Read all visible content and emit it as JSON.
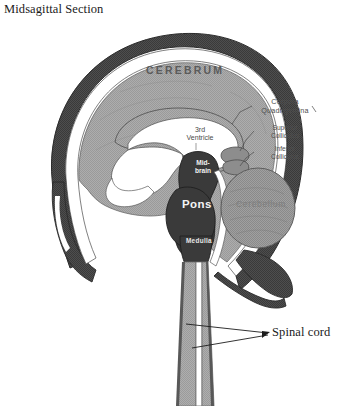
{
  "figure": {
    "title": "Midsagittal Section",
    "width": 345,
    "height": 406
  },
  "labels": {
    "cerebrum": "CEREBRUM",
    "corpora_quadrigemina": "Corpora\nQuadrigemina",
    "corpora_quadrigemina_line1": "Corpora",
    "corpora_quadrigemina_line2": "Quadrigemina",
    "superior_colliculus_line1": "Superior",
    "superior_colliculus_line2": "Colliculus",
    "inferior_colliculus_line1": "Inferior",
    "inferior_colliculus_line2": "Colliculus",
    "third_ventricle_line1": "3rd",
    "third_ventricle_line2": "Ventricle",
    "midbrain_line1": "Mid-",
    "midbrain_line2": "brain",
    "pons": "Pons",
    "cerebellum": "Cerebellum",
    "medulla": "Medulla",
    "spinal_cord": "Spinal cord"
  },
  "colors": {
    "background": "#ffffff",
    "skull_outer": "#4a4a4a",
    "skull_dark": "#3d3d3d",
    "csf_white": "#ffffff",
    "cerebrum_gray": "#9e9e9e",
    "cerebrum_gray_light": "#ababab",
    "brainstem_dark": "#3a3a3a",
    "cerebellum_gray": "#8f8f8f",
    "spinal_cord_gray": "#9a9a9a",
    "outline": "#2b2b2b",
    "title_text": "#1a1a1a",
    "label_light_text": "#f2f2f2",
    "label_dark_text": "#4e4e4e"
  }
}
